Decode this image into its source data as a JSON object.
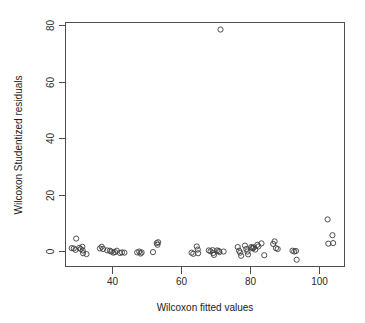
{
  "chart_data": {
    "type": "scatter",
    "title": "",
    "xlabel": "Wilcoxon fitted values",
    "ylabel": "Wilcoxon Studentized residuals",
    "xlim": [
      26.5,
      107.5
    ],
    "ylim": [
      -5.5,
      81.0
    ],
    "xticks": [
      40,
      60,
      80,
      100
    ],
    "yticks": [
      0,
      20,
      40,
      60,
      80
    ],
    "xtick_labels": [
      "40",
      "60",
      "80",
      "100"
    ],
    "ytick_labels": [
      "0",
      "20",
      "40",
      "60",
      "80"
    ],
    "grid": false,
    "legend": null,
    "marker": "open-circle",
    "marker_color": "#3c3c3c",
    "box_color": "#4d4d4d",
    "points": [
      [
        29.6,
        4.4
      ],
      [
        28.3,
        1.0
      ],
      [
        28.9,
        0.9
      ],
      [
        29.4,
        0.4
      ],
      [
        30.5,
        1.1
      ],
      [
        30.9,
        0.7
      ],
      [
        31.4,
        1.5
      ],
      [
        31.5,
        0.2
      ],
      [
        31.6,
        -0.8
      ],
      [
        32.6,
        -1.1
      ],
      [
        36.5,
        0.9
      ],
      [
        37.0,
        1.5
      ],
      [
        37.4,
        0.7
      ],
      [
        38.6,
        0.2
      ],
      [
        39.4,
        0.1
      ],
      [
        39.8,
        -0.2
      ],
      [
        40.4,
        -0.6
      ],
      [
        40.9,
        -0.4
      ],
      [
        41.4,
        0.1
      ],
      [
        42.3,
        -0.7
      ],
      [
        42.9,
        -0.5
      ],
      [
        43.6,
        -0.6
      ],
      [
        47.3,
        -0.5
      ],
      [
        47.9,
        -0.2
      ],
      [
        48.3,
        -0.9
      ],
      [
        48.6,
        -0.5
      ],
      [
        51.9,
        -0.4
      ],
      [
        53.0,
        2.8
      ],
      [
        53.2,
        2.2
      ],
      [
        53.4,
        3.1
      ],
      [
        63.1,
        -0.6
      ],
      [
        63.6,
        -1.0
      ],
      [
        64.6,
        1.6
      ],
      [
        64.9,
        0.5
      ],
      [
        65.0,
        -0.8
      ],
      [
        68.1,
        0.2
      ],
      [
        68.6,
        -0.1
      ],
      [
        69.2,
        0.3
      ],
      [
        69.4,
        -0.7
      ],
      [
        69.6,
        -1.4
      ],
      [
        70.5,
        0.2
      ],
      [
        71.0,
        0.0
      ],
      [
        71.2,
        -0.4
      ],
      [
        71.5,
        78.5
      ],
      [
        72.4,
        -0.2
      ],
      [
        76.5,
        1.4
      ],
      [
        76.9,
        0.1
      ],
      [
        77.2,
        -0.6
      ],
      [
        77.5,
        -1.7
      ],
      [
        78.6,
        1.9
      ],
      [
        79.0,
        0.7
      ],
      [
        79.3,
        -0.2
      ],
      [
        79.5,
        -1.2
      ],
      [
        80.4,
        1.4
      ],
      [
        80.7,
        1.1
      ],
      [
        80.9,
        0.9
      ],
      [
        81.2,
        1.3
      ],
      [
        81.6,
        0.5
      ],
      [
        82.2,
        2.2
      ],
      [
        82.5,
        1.6
      ],
      [
        83.4,
        2.7
      ],
      [
        84.2,
        -1.5
      ],
      [
        86.8,
        2.5
      ],
      [
        87.2,
        3.4
      ],
      [
        87.6,
        1.0
      ],
      [
        88.1,
        0.7
      ],
      [
        92.4,
        0.1
      ],
      [
        92.9,
        -0.2
      ],
      [
        93.4,
        0.0
      ],
      [
        93.6,
        -3.1
      ],
      [
        102.6,
        11.2
      ],
      [
        104.0,
        5.6
      ],
      [
        102.8,
        2.6
      ],
      [
        104.2,
        2.8
      ]
    ]
  }
}
